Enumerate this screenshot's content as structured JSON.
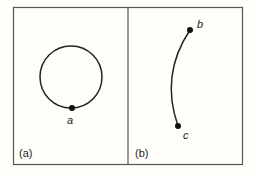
{
  "panels": [
    {
      "id": "a",
      "label": "(a)",
      "shape": "closed circle",
      "points": [
        {
          "name": "a"
        }
      ]
    },
    {
      "id": "b",
      "label": "(b)",
      "shape": "open arc",
      "points": [
        {
          "name": "b"
        },
        {
          "name": "c"
        }
      ]
    }
  ],
  "colors": {
    "stroke": "#222222",
    "frame": "#555555",
    "background": "#fefefb"
  }
}
